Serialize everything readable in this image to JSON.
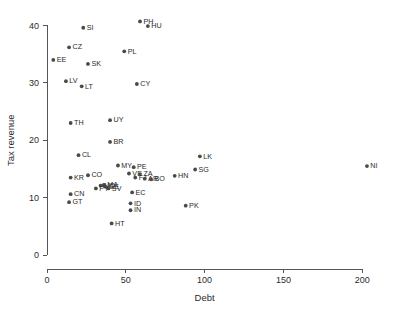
{
  "chart_data": {
    "type": "scatter",
    "title": "",
    "xlabel": "Debt",
    "ylabel": "Tax revenue",
    "xlim": [
      0,
      210
    ],
    "ylim": [
      0,
      42
    ],
    "xticks": [
      0,
      50,
      100,
      150,
      200
    ],
    "yticks": [
      0,
      10,
      20,
      30,
      40
    ],
    "grid": false,
    "legend": null,
    "marker_color": "#4a4a4a",
    "axis_color": "#555555",
    "points": [
      {
        "label": "PH",
        "x": 59,
        "y": 40.7
      },
      {
        "label": "HU",
        "x": 64,
        "y": 39.9
      },
      {
        "label": "SI",
        "x": 23,
        "y": 39.6
      },
      {
        "label": "CZ",
        "x": 14,
        "y": 36.2
      },
      {
        "label": "PL",
        "x": 49,
        "y": 35.5
      },
      {
        "label": "EE",
        "x": 4,
        "y": 34.0
      },
      {
        "label": "SK",
        "x": 26,
        "y": 33.3
      },
      {
        "label": "LV",
        "x": 12,
        "y": 30.3
      },
      {
        "label": "CY",
        "x": 57,
        "y": 29.8
      },
      {
        "label": "LT",
        "x": 22,
        "y": 29.4
      },
      {
        "label": "UY",
        "x": 40,
        "y": 23.5
      },
      {
        "label": "TH",
        "x": 15,
        "y": 23.0
      },
      {
        "label": "BR",
        "x": 40,
        "y": 19.7
      },
      {
        "label": "LK",
        "x": 97,
        "y": 17.2
      },
      {
        "label": "CL",
        "x": 20,
        "y": 17.4
      },
      {
        "label": "MY",
        "x": 45,
        "y": 15.6
      },
      {
        "label": "NI",
        "x": 203,
        "y": 15.5
      },
      {
        "label": "PE",
        "x": 55,
        "y": 15.3
      },
      {
        "label": "SG",
        "x": 94,
        "y": 14.9
      },
      {
        "label": "VE",
        "x": 52,
        "y": 14.2
      },
      {
        "label": "ZA",
        "x": 59,
        "y": 14.1
      },
      {
        "label": "CO",
        "x": 26,
        "y": 13.9
      },
      {
        "label": "HN",
        "x": 81,
        "y": 13.8
      },
      {
        "label": "KR",
        "x": 15,
        "y": 13.5
      },
      {
        "label": "FJ",
        "x": 56,
        "y": 13.5
      },
      {
        "label": "AR",
        "x": 62,
        "y": 13.3
      },
      {
        "label": "BO",
        "x": 66,
        "y": 13.2
      },
      {
        "label": "MA",
        "x": 36,
        "y": 12.2
      },
      {
        "label": "MD",
        "x": 34,
        "y": 12.1
      },
      {
        "label": "GE",
        "x": 37,
        "y": 11.9
      },
      {
        "label": "SV",
        "x": 39,
        "y": 11.6
      },
      {
        "label": "PY",
        "x": 31,
        "y": 11.6
      },
      {
        "label": "CN",
        "x": 15,
        "y": 10.6
      },
      {
        "label": "EC",
        "x": 54,
        "y": 10.9
      },
      {
        "label": "GT",
        "x": 14,
        "y": 9.2
      },
      {
        "label": "ID",
        "x": 53,
        "y": 9.0
      },
      {
        "label": "PK",
        "x": 88,
        "y": 8.6
      },
      {
        "label": "IN",
        "x": 53,
        "y": 7.8
      },
      {
        "label": "HT",
        "x": 41,
        "y": 5.5
      }
    ]
  }
}
